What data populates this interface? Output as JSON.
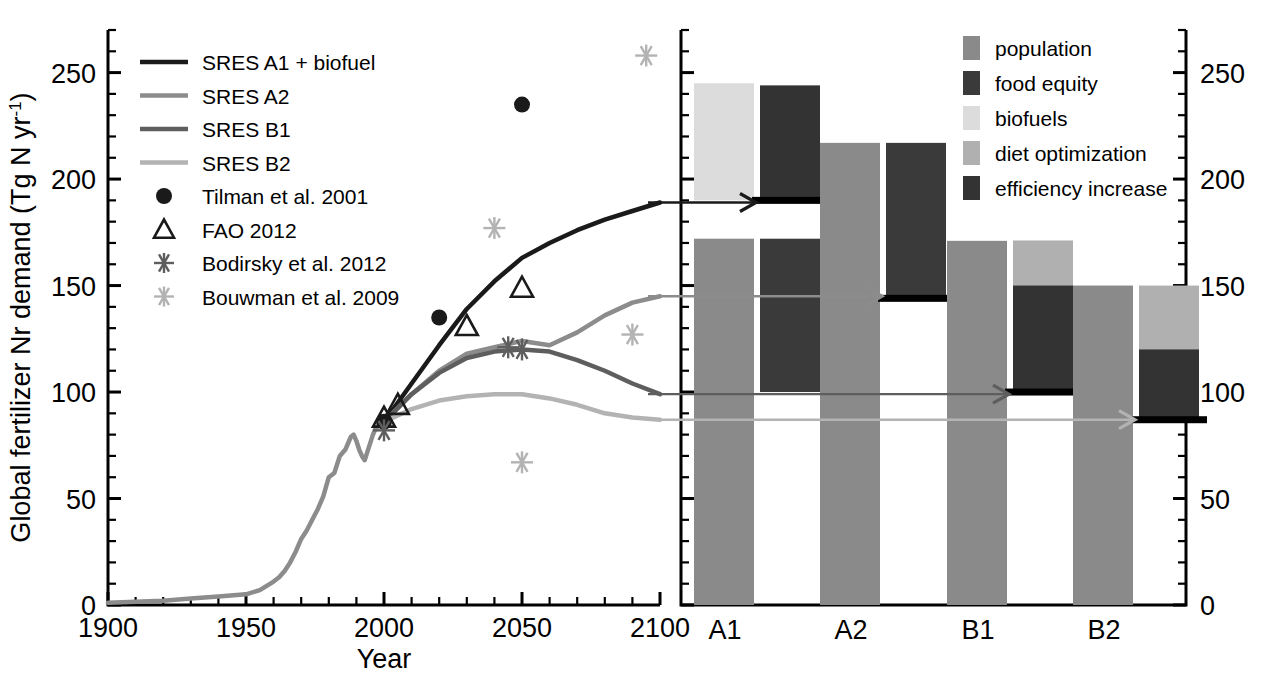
{
  "figure": {
    "ylabel": "Global fertilizer Nr demand (Tg N yr",
    "ylabel_sup": "-1",
    "ylabel_tail": ")",
    "xlabel": "Year"
  },
  "colors": {
    "a1": "#1a1a1a",
    "a2": "#8c8c8c",
    "b1": "#5e5e5e",
    "b2": "#b3b3b3",
    "population": "#8a8a8a",
    "food_equity": "#3a3a3a",
    "biofuels": "#dcdcdc",
    "diet_optimization": "#b0b0b0",
    "efficiency_increase": "#333333",
    "axis": "#000000"
  },
  "left_panel": {
    "y_ticks": [
      "0",
      "50",
      "100",
      "150",
      "200",
      "250"
    ],
    "x_ticks": [
      "1900",
      "1950",
      "2000",
      "2050",
      "2100"
    ],
    "ylim": [
      0,
      270
    ],
    "xlim": [
      1900,
      2100
    ],
    "legend": [
      {
        "label": "SRES A1 + biofuel",
        "marker": "line",
        "color_key": "a1",
        "width": 4.5
      },
      {
        "label": "SRES A2",
        "marker": "line",
        "color_key": "a2",
        "width": 4.5
      },
      {
        "label": "SRES B1",
        "marker": "line",
        "color_key": "b1",
        "width": 4.5
      },
      {
        "label": "SRES B2",
        "marker": "line",
        "color_key": "b2",
        "width": 4.5
      },
      {
        "label": "Tilman et al. 2001",
        "marker": "filled-circle",
        "color_key": "a1"
      },
      {
        "label": "FAO 2012",
        "marker": "open-triangle",
        "color_key": "a1"
      },
      {
        "label": "Bodirsky et al. 2012",
        "marker": "asterisk",
        "color_key": "b1"
      },
      {
        "label": "Bouwman et al. 2009",
        "marker": "asterisk",
        "color_key": "b2"
      }
    ]
  },
  "right_panel": {
    "y_ticks": [
      "0",
      "50",
      "100",
      "150",
      "200",
      "250"
    ],
    "x_ticks": [
      "A1",
      "A2",
      "B1",
      "B2"
    ],
    "legend": [
      {
        "label": "population",
        "color_key": "population"
      },
      {
        "label": "food equity",
        "color_key": "food_equity"
      },
      {
        "label": "biofuels",
        "color_key": "biofuels"
      },
      {
        "label": "diet optimization",
        "color_key": "diet_optimization"
      },
      {
        "label": "efficiency increase",
        "color_key": "efficiency_increase"
      }
    ]
  },
  "chart_data": [
    {
      "type": "line",
      "id": "left",
      "title": "",
      "xlabel": "Year",
      "ylabel": "Global fertilizer Nr demand (Tg N yr-1)",
      "xlim": [
        1900,
        2100
      ],
      "ylim": [
        0,
        270
      ],
      "xticks": [
        1900,
        1950,
        2000,
        2050,
        2100
      ],
      "yticks": [
        0,
        50,
        100,
        150,
        200,
        250
      ],
      "grid": false,
      "legend_position": "top-left",
      "series": [
        {
          "name": "Historical",
          "color_key": "a2",
          "x": [
            1900,
            1910,
            1920,
            1930,
            1940,
            1950,
            1955,
            1960,
            1962,
            1964,
            1966,
            1968,
            1970,
            1972,
            1974,
            1976,
            1978,
            1980,
            1982,
            1984,
            1986,
            1988,
            1989,
            1990,
            1991,
            1992,
            1993,
            1994,
            1995,
            1996,
            1997,
            1998,
            1999,
            2000
          ],
          "y": [
            1,
            1.5,
            2,
            3,
            4,
            5,
            7,
            11,
            13,
            16,
            20,
            25,
            31,
            35,
            40,
            45,
            51,
            60,
            62,
            70,
            73,
            79,
            80,
            77,
            73,
            70,
            68,
            72,
            76,
            80,
            83,
            84,
            85,
            86
          ]
        },
        {
          "name": "SRES A1 + biofuel",
          "color_key": "a1",
          "x": [
            2000,
            2010,
            2020,
            2030,
            2040,
            2050,
            2060,
            2070,
            2080,
            2090,
            2100
          ],
          "y": [
            86,
            104,
            122,
            139,
            152,
            163,
            170,
            176,
            181,
            185,
            189
          ]
        },
        {
          "name": "SRES A2",
          "color_key": "a2",
          "x": [
            2000,
            2010,
            2020,
            2030,
            2040,
            2050,
            2060,
            2070,
            2080,
            2090,
            2100
          ],
          "y": [
            86,
            99,
            110,
            118,
            121,
            124,
            122,
            128,
            136,
            142,
            145
          ]
        },
        {
          "name": "SRES B1",
          "color_key": "b1",
          "x": [
            2000,
            2010,
            2020,
            2030,
            2040,
            2050,
            2060,
            2070,
            2080,
            2090,
            2100
          ],
          "y": [
            86,
            99,
            109,
            116,
            119,
            120,
            119,
            115,
            110,
            104,
            99
          ]
        },
        {
          "name": "SRES B2",
          "color_key": "b2",
          "x": [
            2000,
            2010,
            2020,
            2030,
            2040,
            2050,
            2060,
            2070,
            2080,
            2090,
            2100
          ],
          "y": [
            86,
            92,
            96,
            98,
            99,
            99,
            97,
            94,
            90,
            88,
            87
          ]
        }
      ],
      "points": [
        {
          "series": "Tilman et al. 2001",
          "marker": "filled-circle",
          "color_key": "a1",
          "x": 2000,
          "y": 86
        },
        {
          "series": "Tilman et al. 2001",
          "marker": "filled-circle",
          "color_key": "a1",
          "x": 2020,
          "y": 135
        },
        {
          "series": "Tilman et al. 2001",
          "marker": "filled-circle",
          "color_key": "a1",
          "x": 2050,
          "y": 235
        },
        {
          "series": "FAO 2012",
          "marker": "open-triangle",
          "color_key": "a1",
          "x": 2000,
          "y": 88
        },
        {
          "series": "FAO 2012",
          "marker": "open-triangle",
          "color_key": "a1",
          "x": 2005,
          "y": 94
        },
        {
          "series": "FAO 2012",
          "marker": "open-triangle",
          "color_key": "a1",
          "x": 2030,
          "y": 131
        },
        {
          "series": "FAO 2012",
          "marker": "open-triangle",
          "color_key": "a1",
          "x": 2050,
          "y": 149
        },
        {
          "series": "Bodirsky et al. 2012",
          "marker": "asterisk",
          "color_key": "b1",
          "x": 2000,
          "y": 82
        },
        {
          "series": "Bodirsky et al. 2012",
          "marker": "asterisk",
          "color_key": "b1",
          "x": 2045,
          "y": 121
        },
        {
          "series": "Bodirsky et al. 2012",
          "marker": "asterisk",
          "color_key": "b1",
          "x": 2050,
          "y": 120
        },
        {
          "series": "Bouwman et al. 2009",
          "marker": "asterisk",
          "color_key": "b2",
          "x": 2040,
          "y": 177
        },
        {
          "series": "Bouwman et al. 2009",
          "marker": "asterisk",
          "color_key": "b2",
          "x": 2050,
          "y": 67
        },
        {
          "series": "Bouwman et al. 2009",
          "marker": "asterisk",
          "color_key": "b2",
          "x": 2095,
          "y": 258
        },
        {
          "series": "Bouwman et al. 2009",
          "marker": "asterisk",
          "color_key": "b2",
          "x": 2090,
          "y": 127
        }
      ]
    },
    {
      "type": "bar",
      "id": "right",
      "title": "",
      "xlabel": "",
      "ylabel": "Global fertilizer Nr demand (Tg N yr-1)",
      "ylim": [
        0,
        270
      ],
      "yticks": [
        0,
        50,
        100,
        150,
        200,
        250
      ],
      "categories": [
        "A1",
        "A2",
        "B1",
        "B2"
      ],
      "grid": false,
      "legend_position": "top-right",
      "scenario_level": [
        189,
        144,
        100,
        87
      ],
      "groups": [
        {
          "category": "A1",
          "population_top": 172,
          "population_base": 0,
          "food_equity_from": 100,
          "food_equity_to": 172,
          "second_column": {
            "from": 190,
            "to": 245,
            "color_key": "biofuels"
          },
          "third_column": {
            "from": 190,
            "to": 244,
            "color_key": "efficiency_increase"
          },
          "baseline_marker": 190
        },
        {
          "category": "A2",
          "population_top": 217,
          "population_base": 0,
          "food_equity_from": 144,
          "food_equity_to": 217,
          "baseline_marker": 144
        },
        {
          "category": "B1",
          "population_top": 171,
          "population_base": 0,
          "food_equity_from": 100,
          "food_equity_to": 171,
          "second_column": {
            "from": 100,
            "to": 150,
            "color_key": "efficiency_increase"
          },
          "diet_column": {
            "from": 150,
            "to": 171,
            "color_key": "diet_optimization"
          },
          "baseline_marker": 100
        },
        {
          "category": "B2",
          "population_top": 150,
          "population_base": 0,
          "diet_column": {
            "from": 120,
            "to": 150,
            "color_key": "diet_optimization"
          },
          "second_column": {
            "from": 87,
            "to": 132,
            "color_key": "efficiency_increase"
          },
          "baseline_marker": 87
        }
      ]
    }
  ]
}
